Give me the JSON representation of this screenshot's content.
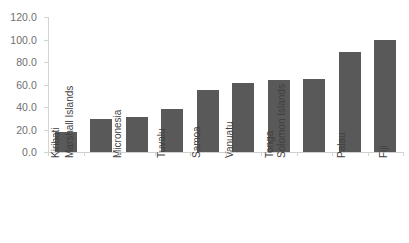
{
  "chart_data": {
    "type": "bar",
    "title": "",
    "subtitle": "",
    "xlabel": "",
    "ylabel": "",
    "categories": [
      "Kiribati",
      "Marshall Islands",
      "Micronesia",
      "Tuvalu",
      "Samoa",
      "Vanuatu",
      "Tonga",
      "Solomon Islands",
      "Palau",
      "Fiji"
    ],
    "values": [
      18.0,
      29.0,
      31.0,
      38.0,
      55.0,
      61.0,
      64.0,
      65.0,
      89.0,
      100.0
    ],
    "ylim": [
      0.0,
      120.0
    ],
    "ytick_labels": [
      "120.0",
      "100.0",
      "80.0",
      "60.0",
      "40.0",
      "20.0",
      "0.0"
    ],
    "ytick_values": [
      120.0,
      100.0,
      80.0,
      60.0,
      40.0,
      20.0,
      0.0
    ],
    "ytick_step": 20.0,
    "grid": false,
    "legend": "none",
    "bar_color": "#595959",
    "axis_color": "#d4d4d4",
    "tick_label_color": "#6f6f6f",
    "category_label_color": "#3f3f3f",
    "background_color": "#ffffff",
    "x_label_rotation": -90
  }
}
